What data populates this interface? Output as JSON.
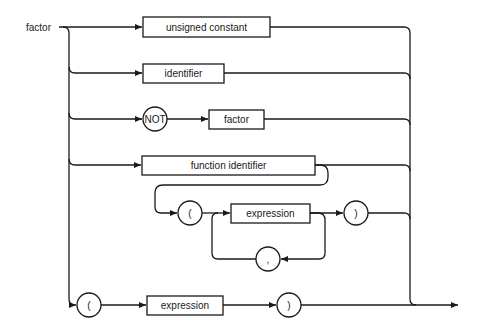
{
  "diagram": {
    "type": "syntax-diagram",
    "title": "factor",
    "branches": [
      {
        "name": "unsigned-constant",
        "elements": [
          {
            "kind": "box",
            "label": "unsigned constant"
          }
        ]
      },
      {
        "name": "identifier",
        "elements": [
          {
            "kind": "box",
            "label": "identifier"
          }
        ]
      },
      {
        "name": "not-factor",
        "elements": [
          {
            "kind": "circle",
            "label": "NOT"
          },
          {
            "kind": "box",
            "label": "factor"
          }
        ]
      },
      {
        "name": "function-call",
        "elements": [
          {
            "kind": "box",
            "label": "function identifier"
          },
          {
            "kind": "circle",
            "label": "("
          },
          {
            "kind": "box",
            "label": "expression"
          },
          {
            "kind": "circle",
            "label": ")"
          }
        ],
        "loop": {
          "kind": "circle",
          "label": ","
        },
        "optional_args": true
      },
      {
        "name": "parenthesized",
        "elements": [
          {
            "kind": "circle",
            "label": "("
          },
          {
            "kind": "box",
            "label": "expression"
          },
          {
            "kind": "circle",
            "label": ")"
          }
        ]
      }
    ]
  },
  "labels": {
    "title": "factor",
    "unsigned_constant": "unsigned constant",
    "identifier": "identifier",
    "not": "NOT",
    "factor": "factor",
    "function_identifier": "function identifier",
    "open_paren": "(",
    "expression": "expression",
    "close_paren": ")",
    "comma": ",",
    "open_paren_2": "(",
    "expression_2": "expression",
    "close_paren_2": ")"
  }
}
